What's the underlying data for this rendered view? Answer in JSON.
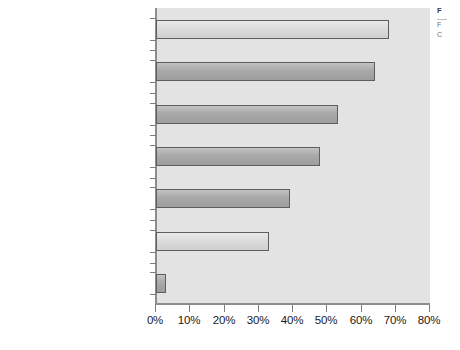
{
  "chart_data": {
    "type": "bar",
    "orientation": "horizontal",
    "title": "",
    "xlabel": "",
    "ylabel": "",
    "xlim": [
      0,
      80
    ],
    "xticks": [
      "0%",
      "10%",
      "20%",
      "30%",
      "40%",
      "50%",
      "60%",
      "70%",
      "80%"
    ],
    "xtick_values": [
      0,
      10,
      20,
      30,
      40,
      50,
      60,
      70,
      80
    ],
    "grid": false,
    "legend": "none",
    "categories": [
      "Tap outside sources of expertise",
      "Concentrate resources on core business",
      "Reduce head count and related expenses",
      "Eliminate the need to reinvest in technology",
      "Reduce costs",
      "Better manage the costs of internal processes",
      "Other"
    ],
    "values": [
      68,
      64,
      53,
      48,
      39,
      33,
      3
    ]
  },
  "categories": [
    {
      "line1": "Tap outside sources",
      "line2": "of expertise",
      "value": 68,
      "shade": "light"
    },
    {
      "line1": "Concentrate resources",
      "line2": "on core business",
      "value": 64,
      "shade": "dark"
    },
    {
      "line1": "Reduce head count and",
      "line2": "related expenses",
      "value": 53,
      "shade": "dark"
    },
    {
      "line1": "Eliminate the need to",
      "line2": "reinvest in technology",
      "value": 48,
      "shade": "dark"
    },
    {
      "line1": "Reduce costs",
      "line2": "",
      "value": 39,
      "shade": "dark"
    },
    {
      "line1": "Better manage the costs",
      "line2": "of internal processes",
      "value": 33,
      "shade": "light"
    },
    {
      "line1": "Other",
      "line2": "",
      "value": 3,
      "shade": "dark"
    }
  ],
  "axis": {
    "ticks": [
      "0%",
      "10%",
      "20%",
      "30%",
      "40%",
      "50%",
      "60%",
      "70%",
      "80%"
    ]
  },
  "side_caption": {
    "title": "F",
    "line1": "F",
    "line2": "C"
  },
  "colors": {
    "plot_background": "#e3e3e3",
    "bar_light": "#dcdcdc",
    "bar_dark": "#a9a9a9",
    "bar_border": "#5e5e5e",
    "axis": "#8d8d8d",
    "text": "#1a1a1a"
  }
}
